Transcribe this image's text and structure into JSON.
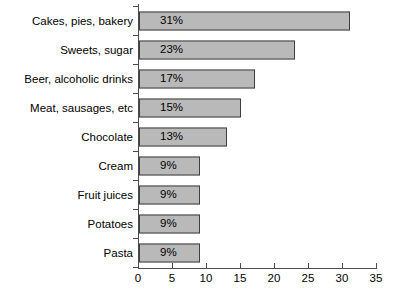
{
  "chart_data": {
    "type": "bar",
    "orientation": "horizontal",
    "title": "",
    "subtitle": "",
    "xlabel": "",
    "ylabel": "",
    "xlim": [
      0,
      35
    ],
    "xticks": [
      0,
      5,
      10,
      15,
      20,
      25,
      30,
      35
    ],
    "xtick_labels": [
      "0",
      "5",
      "10",
      "15",
      "20",
      "25",
      "30",
      "35"
    ],
    "grid": false,
    "legend": null,
    "categories": [
      "Cakes, pies, bakery",
      "Sweets, sugar",
      "Beer, alcoholic drinks",
      "Meat, sausages, etc",
      "Chocolate",
      "Cream",
      "Fruit juices",
      "Potatoes",
      "Pasta"
    ],
    "values": [
      31,
      23,
      17,
      15,
      13,
      9,
      9,
      9,
      9
    ],
    "data_labels": [
      "31%",
      "23%",
      "17%",
      "15%",
      "13%",
      "9%",
      "9%",
      "9%",
      "9%"
    ],
    "bar_fill_color": "#b9b9b9",
    "bar_border_color": "#3f3f3f",
    "axis_color": "#4c4c4c",
    "background_color": "#ffffff"
  }
}
